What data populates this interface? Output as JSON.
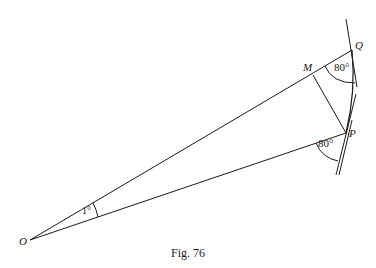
{
  "figure": {
    "caption": "Fig. 76",
    "points": {
      "O": {
        "label": "O",
        "x": 30,
        "y": 240
      },
      "M": {
        "label": "M",
        "x": 313,
        "y": 75
      },
      "Q": {
        "label": "Q",
        "x": 352,
        "y": 50
      },
      "P": {
        "label": "P",
        "x": 346,
        "y": 133
      }
    },
    "angles": {
      "at_O": "1°",
      "at_Q": "80°",
      "at_P": "80°"
    },
    "line_color": "#1a1a1a"
  }
}
